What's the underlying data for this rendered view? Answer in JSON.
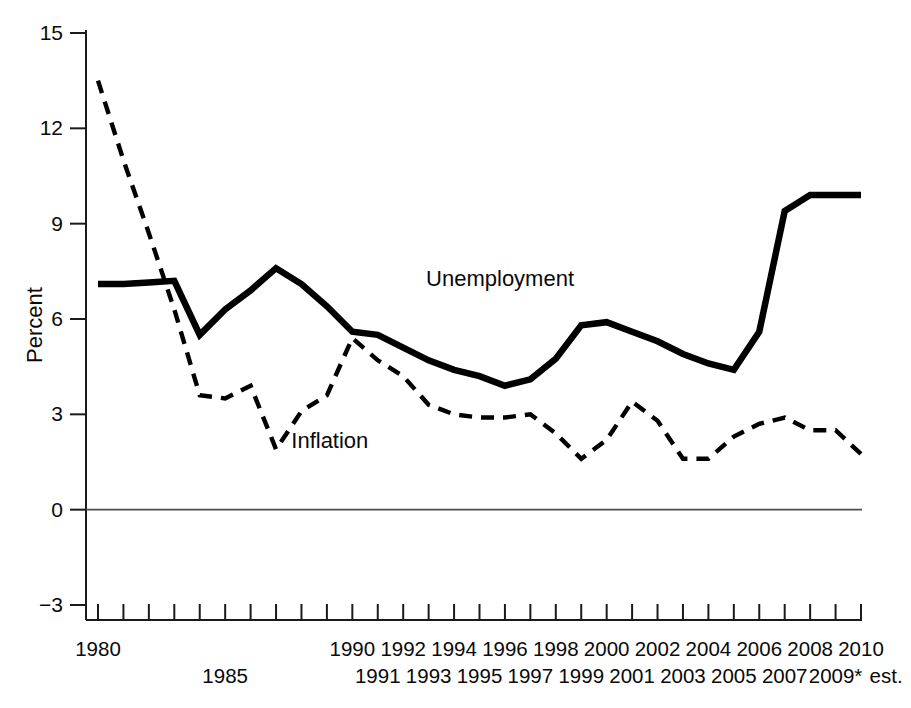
{
  "chart_data": {
    "type": "line",
    "title": "",
    "xlabel": "",
    "ylabel": "Percent",
    "ylim": [
      -3,
      15
    ],
    "yticks": [
      -3,
      0,
      3,
      6,
      9,
      12,
      15
    ],
    "ytick_labels": [
      "−3",
      "0",
      "3",
      "6",
      "9",
      "12",
      "15"
    ],
    "xlim": [
      1980,
      2010
    ],
    "grid": false,
    "legend_position": "inline-annotations",
    "zero_line": 0,
    "x": [
      1980,
      1981,
      1982,
      1983,
      1984,
      1985,
      1986,
      1987,
      1988,
      1989,
      1990,
      1991,
      1992,
      1993,
      1994,
      1995,
      1996,
      1997,
      1998,
      1999,
      2000,
      2001,
      2002,
      2003,
      2004,
      2005,
      2006,
      2007,
      2008,
      2009,
      2010
    ],
    "xtick_labels_upper": [
      "1980",
      "",
      "",
      "",
      "",
      "",
      "",
      "",
      "",
      "",
      "1990",
      "",
      "1992",
      "",
      "1994",
      "",
      "1996",
      "",
      "1998",
      "",
      "2000",
      "",
      "2002",
      "",
      "2004",
      "",
      "2006",
      "",
      "2008",
      "",
      "2010"
    ],
    "xtick_labels_lower": [
      "",
      "",
      "",
      "",
      "",
      "1985",
      "",
      "",
      "",
      "",
      "",
      "1991",
      "",
      "1993",
      "",
      "1995",
      "",
      "1997",
      "",
      "1999",
      "",
      "2001",
      "",
      "2003",
      "",
      "2005",
      "",
      "2007",
      "",
      "2009*",
      ""
    ],
    "xtick_note": "est.",
    "series": [
      {
        "name": "Unemployment",
        "style": "solid",
        "label_x": 1992.9,
        "label_y": 7.05,
        "values": [
          7.1,
          7.1,
          7.15,
          7.2,
          5.5,
          6.3,
          6.9,
          7.6,
          7.1,
          6.4,
          5.6,
          5.5,
          5.1,
          4.7,
          4.4,
          4.2,
          3.9,
          4.1,
          4.75,
          5.8,
          5.9,
          5.6,
          5.3,
          4.9,
          4.6,
          4.4,
          5.6,
          9.4,
          9.9,
          9.9,
          9.9
        ]
      },
      {
        "name": "Inflation",
        "style": "dashed",
        "label_x": 1987.6,
        "label_y": 1.95,
        "values": [
          13.5,
          11.0,
          8.7,
          6.3,
          3.6,
          3.5,
          3.9,
          1.9,
          3.1,
          3.6,
          5.4,
          4.7,
          4.2,
          3.3,
          3.0,
          2.9,
          2.9,
          3.0,
          2.4,
          1.6,
          2.2,
          3.4,
          2.8,
          1.6,
          1.6,
          2.3,
          2.7,
          2.9,
          2.5,
          2.5,
          1.75
        ]
      }
    ]
  },
  "axis": {
    "y_title": "Percent"
  }
}
